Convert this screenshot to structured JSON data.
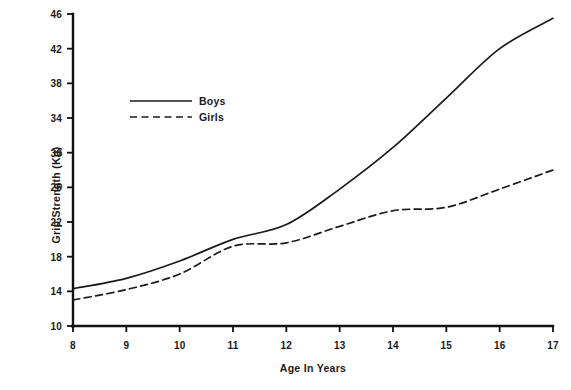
{
  "chart_data": {
    "type": "line",
    "title": "",
    "xlabel": "Age In Years",
    "ylabel": "Grip Strength (Kg)",
    "x": [
      8,
      9,
      10,
      11,
      12,
      13,
      14,
      15,
      16,
      17
    ],
    "xlim": [
      8,
      17
    ],
    "ylim": [
      10,
      46
    ],
    "xticks": [
      8,
      9,
      10,
      11,
      12,
      13,
      14,
      15,
      16,
      17
    ],
    "yticks": [
      10,
      14,
      18,
      22,
      26,
      30,
      34,
      38,
      42,
      46
    ],
    "grid": false,
    "legend_position": "upper-left-inside",
    "series": [
      {
        "name": "Boys",
        "style": "solid",
        "color": "#1a1a1a",
        "values": [
          14.3,
          15.5,
          17.5,
          20.0,
          21.7,
          25.8,
          30.6,
          36.3,
          42.0,
          45.5
        ]
      },
      {
        "name": "Girls",
        "style": "dashed",
        "color": "#1a1a1a",
        "values": [
          13.0,
          14.2,
          16.0,
          19.2,
          19.6,
          21.5,
          23.3,
          23.7,
          25.8,
          28.0
        ]
      }
    ]
  },
  "axes": {
    "x_title": "Age In Years",
    "y_title": "Grip Strength (Kg)",
    "x_tick_labels": [
      "8",
      "9",
      "10",
      "11",
      "12",
      "13",
      "14",
      "15",
      "16",
      "17"
    ],
    "y_tick_labels": [
      "10",
      "14",
      "18",
      "22",
      "26",
      "30",
      "34",
      "38",
      "42",
      "46"
    ]
  },
  "legend": {
    "entries": [
      {
        "label": "Boys",
        "style": "solid"
      },
      {
        "label": "Girls",
        "style": "dashed"
      }
    ]
  },
  "colors": {
    "line": "#1a1a1a",
    "axis": "#111111",
    "background": "#ffffff",
    "text": "#1a1a1a"
  }
}
